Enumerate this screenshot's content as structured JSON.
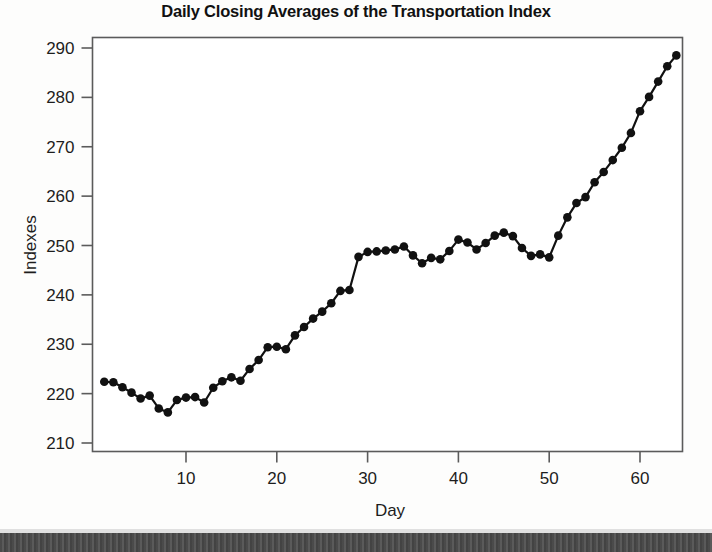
{
  "chart_data": {
    "type": "line",
    "title": "Daily Closing Averages of the Transportation Index",
    "xlabel": "Day",
    "ylabel": "Indexes",
    "xlim": [
      0,
      65
    ],
    "ylim": [
      208,
      292
    ],
    "xticks": [
      10,
      20,
      30,
      40,
      50,
      60
    ],
    "yticks": [
      210,
      220,
      230,
      240,
      250,
      260,
      270,
      280,
      290
    ],
    "grid": false,
    "legend": "none",
    "marker": "filled-circle",
    "line_color": "#111111",
    "marker_color": "#111111",
    "x": [
      1,
      2,
      3,
      4,
      5,
      6,
      7,
      8,
      9,
      10,
      11,
      12,
      13,
      14,
      15,
      16,
      17,
      18,
      19,
      20,
      21,
      22,
      23,
      24,
      25,
      26,
      27,
      28,
      29,
      30,
      31,
      32,
      33,
      34,
      35,
      36,
      37,
      38,
      39,
      40,
      41,
      42,
      43,
      44,
      45,
      46,
      47,
      48,
      49,
      50,
      51,
      52,
      53,
      54,
      55,
      56,
      57,
      58,
      59,
      60,
      61,
      62,
      63,
      64
    ],
    "values": [
      222.4,
      222.3,
      221.3,
      220.2,
      219.0,
      219.6,
      217.0,
      216.2,
      218.7,
      219.2,
      219.3,
      218.2,
      221.2,
      222.5,
      223.3,
      222.6,
      225.0,
      226.8,
      229.4,
      229.5,
      229.0,
      231.8,
      233.5,
      235.2,
      236.6,
      238.3,
      240.8,
      241.0,
      247.7,
      248.7,
      248.8,
      249.0,
      249.2,
      249.8,
      248.0,
      246.4,
      247.5,
      247.2,
      248.9,
      251.2,
      250.6,
      249.2,
      250.5,
      252.0,
      252.6,
      251.9,
      249.5,
      247.9,
      248.2,
      247.6,
      252.0,
      255.7,
      258.6,
      259.8,
      262.8,
      264.9,
      267.3,
      269.8,
      272.8,
      277.2,
      280.1,
      283.2,
      286.3,
      288.5
    ]
  },
  "axes": {
    "y_tick_labels": [
      "290",
      "280",
      "270",
      "260",
      "250",
      "240",
      "230",
      "220",
      "210"
    ],
    "x_tick_labels": [
      "10",
      "20",
      "30",
      "40",
      "50",
      "60"
    ]
  }
}
